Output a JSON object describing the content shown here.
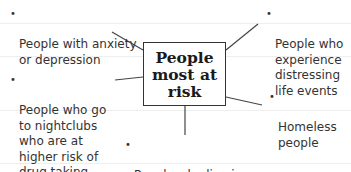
{
  "diagram": {
    "type": "spider-diagram",
    "center": {
      "label": "People\nmost at\nrisk"
    },
    "nodes": [
      {
        "id": "anxiety",
        "label": "People with anxiety\nor depression"
      },
      {
        "id": "nightclubs",
        "label": "People who go\nto nightclubs\nwho are at\nhigher risk of\ndrug taking"
      },
      {
        "id": "deprived",
        "label": "People who live in\ndeprived areas"
      },
      {
        "id": "life-events",
        "label": "People who\nexperience\ndistressing\nlife events"
      },
      {
        "id": "homeless",
        "label": "Homeless\npeople"
      }
    ],
    "bullet": "•"
  }
}
